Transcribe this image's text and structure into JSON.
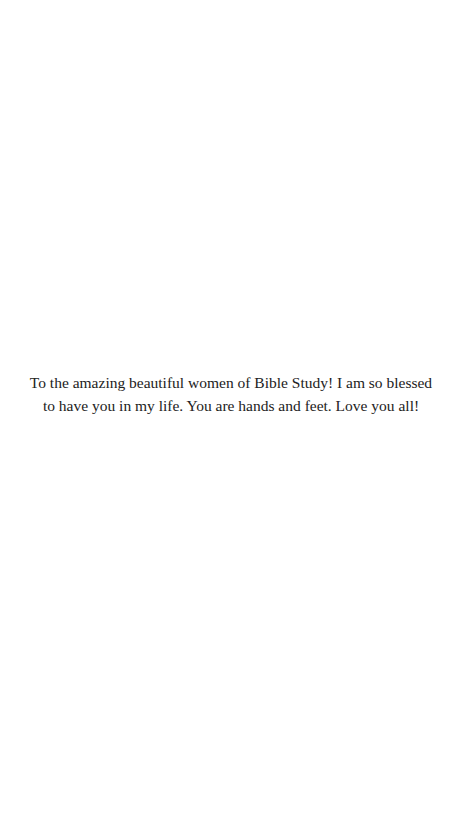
{
  "page": {
    "background_color": "#ffffff",
    "text_color": "#222222"
  },
  "dedication": {
    "lines": [
      "To the amazing beautiful women of Bible Study! I am so blessed",
      "to have you in my life. You are hands and feet. Love you all!"
    ]
  }
}
